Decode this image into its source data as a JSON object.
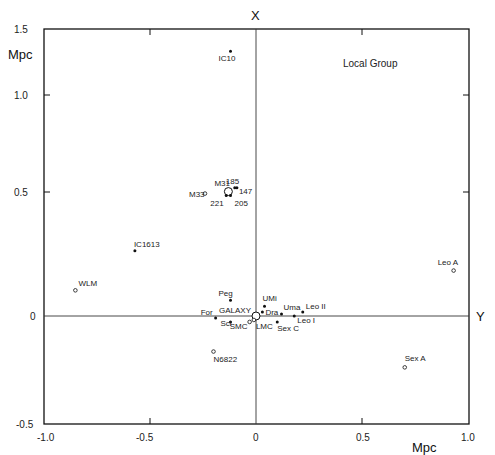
{
  "chart_data": {
    "type": "scatter",
    "title": "Local Group",
    "xlabel": "Mpc",
    "ylabel": "Mpc",
    "x_axis_name": "Y",
    "y_axis_name": "X",
    "xlim": [
      -1.0,
      1.0
    ],
    "ylim": [
      -0.5,
      1.5
    ],
    "grid": false,
    "x_ticks": [
      "-1.0",
      "-0.5",
      "0",
      "0.5",
      "1.0"
    ],
    "y_ticks": [
      "-0.5",
      "0",
      "0.5",
      "1.0",
      "1.5"
    ],
    "points": [
      {
        "name": "IC10",
        "x": -0.12,
        "y": 1.34,
        "marker": "dot"
      },
      {
        "name": "M31",
        "x": -0.13,
        "y": 0.63,
        "marker": "circle-large"
      },
      {
        "name": "M33",
        "x": -0.24,
        "y": 0.62,
        "marker": "circle"
      },
      {
        "name": "185",
        "x": -0.1,
        "y": 0.65,
        "marker": "dot"
      },
      {
        "name": "147",
        "x": -0.09,
        "y": 0.65,
        "marker": "dot"
      },
      {
        "name": "221",
        "x": -0.14,
        "y": 0.61,
        "marker": "dot"
      },
      {
        "name": "205",
        "x": -0.12,
        "y": 0.61,
        "marker": "dot"
      },
      {
        "name": "IC1613",
        "x": -0.57,
        "y": 0.33,
        "marker": "dot"
      },
      {
        "name": "WLM",
        "x": -0.85,
        "y": 0.13,
        "marker": "circle"
      },
      {
        "name": "Leo A",
        "x": 0.93,
        "y": 0.23,
        "marker": "circle"
      },
      {
        "name": "Peg",
        "x": -0.12,
        "y": 0.08,
        "marker": "dot"
      },
      {
        "name": "UMi",
        "x": 0.04,
        "y": 0.05,
        "marker": "dot"
      },
      {
        "name": "Dra",
        "x": 0.03,
        "y": 0.02,
        "marker": "dot"
      },
      {
        "name": "Uma",
        "x": 0.12,
        "y": 0.01,
        "marker": "dot"
      },
      {
        "name": "Leo II",
        "x": 0.22,
        "y": 0.02,
        "marker": "dot"
      },
      {
        "name": "Leo I",
        "x": 0.18,
        "y": 0.0,
        "marker": "dot"
      },
      {
        "name": "Sex C",
        "x": 0.1,
        "y": -0.03,
        "marker": "dot"
      },
      {
        "name": "GALAXY",
        "x": 0.0,
        "y": 0.0,
        "marker": "circle-large"
      },
      {
        "name": "For",
        "x": -0.19,
        "y": -0.01,
        "marker": "dot"
      },
      {
        "name": "Scl",
        "x": -0.12,
        "y": -0.03,
        "marker": "dot"
      },
      {
        "name": "SMC",
        "x": -0.03,
        "y": -0.03,
        "marker": "circle"
      },
      {
        "name": "LMC",
        "x": -0.01,
        "y": -0.02,
        "marker": "circle"
      },
      {
        "name": "N6822",
        "x": -0.2,
        "y": -0.18,
        "marker": "circle"
      },
      {
        "name": "Sex A",
        "x": 0.7,
        "y": -0.26,
        "marker": "circle"
      }
    ]
  },
  "labels": {
    "title": "Local Group",
    "x_axis_top": "X",
    "y_axis_right": "Y",
    "unit_left": "Mpc",
    "unit_bottom": "Mpc"
  }
}
